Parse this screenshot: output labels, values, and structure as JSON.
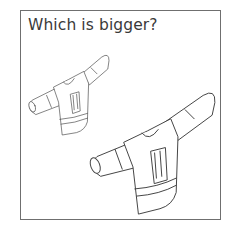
{
  "question": "Which is bigger?",
  "options": [
    {
      "id": "small",
      "label": "small jersey"
    },
    {
      "id": "big",
      "label": "big jersey"
    }
  ],
  "colors": {
    "border": "#6f6f6f",
    "text": "#3a3a3a",
    "line": "#444444"
  }
}
